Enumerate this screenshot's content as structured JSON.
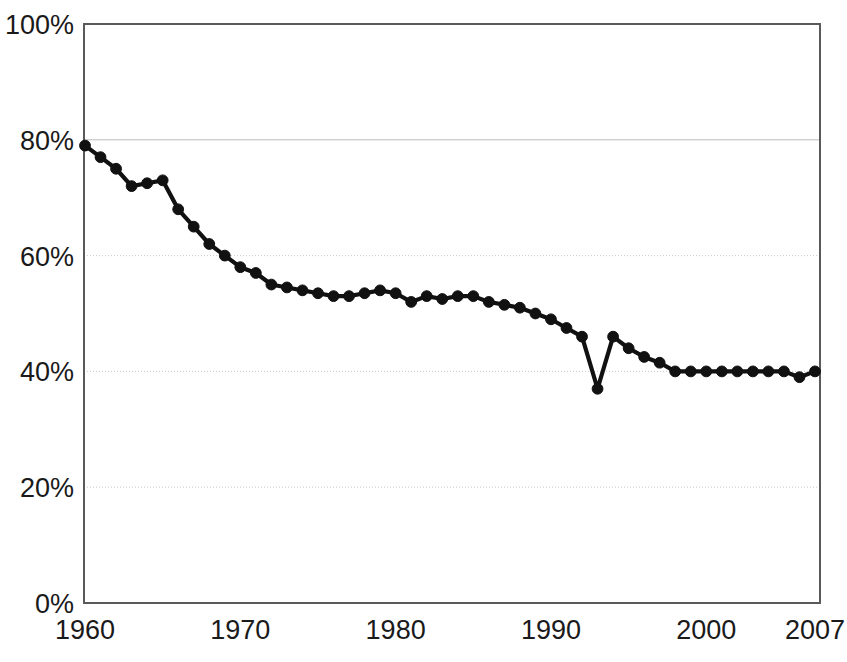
{
  "chart_data": {
    "type": "line",
    "title": "",
    "subtitle": "",
    "xlabel": "",
    "ylabel": "",
    "xlim": [
      1960,
      2007
    ],
    "ylim": [
      0,
      100
    ],
    "grid": true,
    "legend": null,
    "legend_position": "none",
    "x_tick_labels": [
      "1960",
      "1970",
      "1980",
      "1990",
      "2000",
      "2007"
    ],
    "x_tick_values": [
      1960,
      1970,
      1980,
      1990,
      2000,
      2007
    ],
    "y_tick_labels": [
      "0%",
      "20%",
      "40%",
      "60%",
      "80%",
      "100%"
    ],
    "y_tick_values": [
      0,
      20,
      40,
      60,
      80,
      100
    ],
    "series": [
      {
        "name": "percent",
        "marker": "circle",
        "color": "#111111",
        "x": [
          1960,
          1961,
          1962,
          1963,
          1964,
          1965,
          1966,
          1967,
          1968,
          1969,
          1970,
          1971,
          1972,
          1973,
          1974,
          1975,
          1976,
          1977,
          1978,
          1979,
          1980,
          1981,
          1982,
          1983,
          1984,
          1985,
          1986,
          1987,
          1988,
          1989,
          1990,
          1991,
          1992,
          1993,
          1994,
          1995,
          1996,
          1997,
          1998,
          1999,
          2000,
          2001,
          2002,
          2003,
          2004,
          2005,
          2006,
          2007
        ],
        "values": [
          79,
          77,
          75,
          72,
          72.5,
          73,
          68,
          65,
          62,
          60,
          58,
          57,
          55,
          54.5,
          54,
          53.5,
          53,
          53,
          53.5,
          54,
          53.5,
          52,
          53,
          52.5,
          53,
          53,
          52,
          51.5,
          51,
          50,
          49,
          47.5,
          46,
          37,
          46,
          44,
          42.5,
          41.5,
          40,
          40,
          40,
          40,
          40,
          40,
          40,
          40,
          39,
          40
        ]
      }
    ]
  },
  "axes": {
    "y_unit": "%",
    "x_unit": "year"
  }
}
